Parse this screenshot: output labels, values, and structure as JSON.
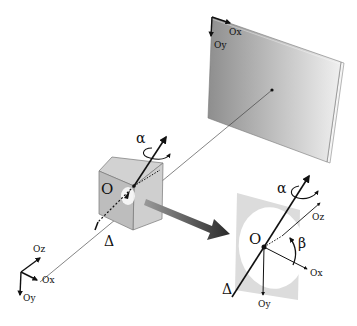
{
  "diagram": {
    "type": "projection-geometry",
    "screen": {
      "label_x": "Ox",
      "label_y": "Oy",
      "fill_colors": [
        "#9a9a9a",
        "#e8e8e8"
      ]
    },
    "cube": {
      "origin_label": "O",
      "rotation_label": "α",
      "axis_label": "Δ",
      "fill_color": "#c8c8c8"
    },
    "world_axes": {
      "x": "Ox",
      "y": "Oy",
      "z": "Oz"
    },
    "detail_view": {
      "origin_label": "O",
      "rotation_label": "α",
      "angle_label": "β",
      "axis_label": "Δ",
      "x": "Ox",
      "y": "Oy",
      "z": "Oz",
      "panel_color": "#dcdcdc"
    },
    "arrow_color": "#444444"
  }
}
